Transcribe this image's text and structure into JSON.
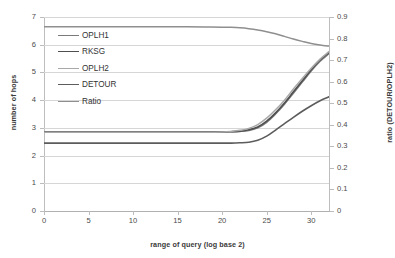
{
  "chart_data": {
    "type": "line",
    "title": "",
    "xlabel": "range of query (log base 2)",
    "ylabel": "number of hops",
    "y2label": "ratio (DETOUR/OPLH2)",
    "xlim": [
      0,
      32
    ],
    "ylim": [
      0,
      7
    ],
    "y2lim": [
      0,
      0.9
    ],
    "grid": true,
    "legend_position": "upper-left-inside",
    "xticks": [
      "0",
      "5",
      "10",
      "15",
      "20",
      "25",
      "30"
    ],
    "xtick_values": [
      0,
      5,
      10,
      15,
      20,
      25,
      30
    ],
    "yticks": [
      "0",
      "1",
      "2",
      "3",
      "4",
      "5",
      "6",
      "7"
    ],
    "ytick_values": [
      0,
      1,
      2,
      3,
      4,
      5,
      6,
      7
    ],
    "y2ticks": [
      "0",
      "0.1",
      "0.2",
      "0.3",
      "0.4",
      "0.5",
      "0.6",
      "0.7",
      "0.8",
      "0.9"
    ],
    "y2tick_values": [
      0,
      0.1,
      0.2,
      0.3,
      0.4,
      0.5,
      0.6,
      0.7,
      0.8,
      0.9
    ],
    "x": [
      0,
      2,
      4,
      6,
      8,
      10,
      12,
      14,
      16,
      18,
      20,
      21,
      22,
      23,
      24,
      25,
      26,
      27,
      28,
      29,
      30,
      31,
      32
    ],
    "series": [
      {
        "name": "OPLH1",
        "axis": "left",
        "color": "#7a7a7a",
        "width": 1.5,
        "values": [
          2.86,
          2.86,
          2.86,
          2.86,
          2.86,
          2.86,
          2.86,
          2.86,
          2.86,
          2.86,
          2.86,
          2.86,
          2.87,
          2.9,
          3.0,
          3.2,
          3.5,
          3.85,
          4.25,
          4.65,
          5.05,
          5.4,
          5.68
        ]
      },
      {
        "name": "RKSG",
        "axis": "left",
        "color": "#4f4f4f",
        "width": 1.6,
        "values": [
          2.85,
          2.85,
          2.85,
          2.85,
          2.85,
          2.85,
          2.85,
          2.85,
          2.85,
          2.85,
          2.85,
          2.86,
          2.88,
          2.93,
          3.03,
          3.24,
          3.54,
          3.9,
          4.3,
          4.7,
          5.1,
          5.45,
          5.72
        ]
      },
      {
        "name": "OPLH2",
        "axis": "left",
        "color": "#a8a8a8",
        "width": 1.5,
        "values": [
          2.84,
          2.84,
          2.84,
          2.84,
          2.84,
          2.84,
          2.84,
          2.84,
          2.84,
          2.84,
          2.85,
          2.87,
          2.91,
          2.98,
          3.12,
          3.35,
          3.65,
          4.0,
          4.4,
          4.78,
          5.15,
          5.48,
          5.75
        ]
      },
      {
        "name": "DETOUR",
        "axis": "left",
        "color": "#5c5c5c",
        "width": 1.6,
        "values": [
          2.45,
          2.45,
          2.45,
          2.45,
          2.45,
          2.45,
          2.45,
          2.45,
          2.45,
          2.45,
          2.45,
          2.45,
          2.46,
          2.48,
          2.55,
          2.7,
          2.92,
          3.15,
          3.38,
          3.6,
          3.8,
          3.98,
          4.12
        ]
      },
      {
        "name": "Ratio",
        "axis": "right",
        "color": "#8f8f8f",
        "width": 1.5,
        "values": [
          0.855,
          0.855,
          0.855,
          0.855,
          0.855,
          0.855,
          0.855,
          0.855,
          0.855,
          0.854,
          0.853,
          0.852,
          0.85,
          0.846,
          0.84,
          0.832,
          0.822,
          0.81,
          0.798,
          0.787,
          0.777,
          0.77,
          0.765
        ]
      }
    ]
  },
  "legend": {
    "items": [
      {
        "label": "OPLH1"
      },
      {
        "label": "RKSG"
      },
      {
        "label": "OPLH2"
      },
      {
        "label": "DETOUR"
      },
      {
        "label": "Ratio"
      }
    ]
  }
}
